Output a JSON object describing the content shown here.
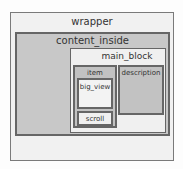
{
  "diagram": {
    "boxes": {
      "wrapper": "wrapper",
      "content_inside": "content_inside",
      "main_block": "main_block",
      "item": "item",
      "description": "description",
      "big_view": "big_view",
      "scroll": "scroll"
    },
    "colors": {
      "outer_bg": "#f1f1f1",
      "gray_fill": "#c8c8c8",
      "light_fill": "#f0f0f0",
      "border": "#666666"
    }
  }
}
